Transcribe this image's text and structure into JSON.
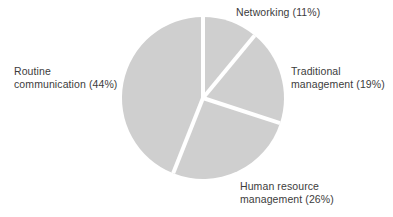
{
  "chart_data": {
    "type": "pie",
    "title": "",
    "start_angle_deg": 0,
    "direction": "clockwise",
    "slice_color": "#cfcfcf",
    "separator_color": "#ffffff",
    "center": [
      203,
      98
    ],
    "radius": 81,
    "categories": [
      "Networking",
      "Traditional management",
      "Human resource management",
      "Routine communication"
    ],
    "values": [
      11,
      19,
      26,
      44
    ],
    "unit": "%",
    "legend": "none (direct labels)",
    "labels": [
      {
        "line1": "Networking (11%)",
        "line2": ""
      },
      {
        "line1": "Traditional",
        "line2": "management (19%)"
      },
      {
        "line1": "Human resource",
        "line2": "management (26%)"
      },
      {
        "line1": "Routine",
        "line2": "communication (44%)"
      }
    ]
  }
}
